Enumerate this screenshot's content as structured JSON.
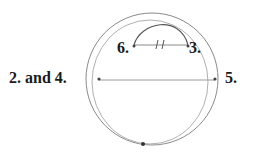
{
  "diagram": {
    "type": "geometric construction",
    "labels": {
      "left": "2. and 4.",
      "right": "5.",
      "top_left": "6.",
      "top_right": "3."
    },
    "colors": {
      "stroke": "#8a8a8a",
      "stroke_light": "#b0b0b0",
      "point": "#333333",
      "text": "#1a1a1a"
    },
    "elements": [
      {
        "kind": "circle",
        "name": "outer-circle"
      },
      {
        "kind": "circle",
        "name": "offset-circle"
      },
      {
        "kind": "chord",
        "name": "horizontal-diameter",
        "from": "2. and 4.",
        "to": "5."
      },
      {
        "kind": "chord",
        "name": "top-chord",
        "from": "6.",
        "to": "3.",
        "tick_marks": 2
      },
      {
        "kind": "arc",
        "name": "top-arc",
        "from": "6.",
        "to": "3."
      },
      {
        "kind": "point",
        "name": "bottom-point"
      }
    ]
  }
}
